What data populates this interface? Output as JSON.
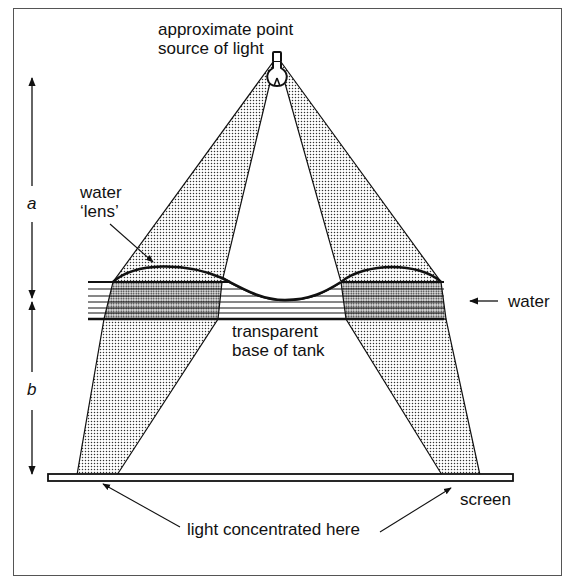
{
  "diagram": {
    "labels": {
      "source_line1": "approximate point",
      "source_line2": "source of light",
      "lens_line1": "water",
      "lens_line2": "‘lens’",
      "water": "water",
      "base_line1": "transparent",
      "base_line2": "base of tank",
      "screen": "screen",
      "concentrated": "light concentrated here",
      "distance_a": "a",
      "distance_b": "b"
    },
    "components": [
      "light-bulb",
      "left-light-beam",
      "right-light-beam",
      "water-tank",
      "water-lens-surface",
      "screen",
      "distance-arrow-a",
      "distance-arrow-b"
    ],
    "colors": {
      "ink": "#111111",
      "frame": "#555555",
      "background": "#ffffff"
    }
  }
}
